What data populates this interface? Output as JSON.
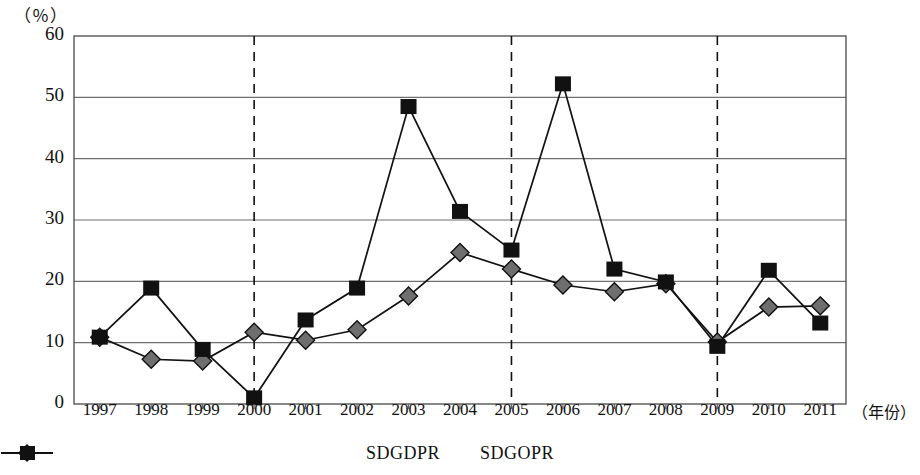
{
  "chart_data": {
    "type": "line",
    "title": "",
    "xlabel": "（年份）",
    "ylabel": "（％）",
    "x": [
      "1997",
      "1998",
      "1999",
      "2000",
      "2001",
      "2002",
      "2003",
      "2004",
      "2005",
      "2006",
      "2007",
      "2008",
      "2009",
      "2010",
      "2011"
    ],
    "ylim": [
      0,
      60
    ],
    "yticks": [
      "0",
      "10",
      "20",
      "30",
      "40",
      "50",
      "60"
    ],
    "grid": "horizontal",
    "legend_position": "bottom-center",
    "series": [
      {
        "name": "SDGDPR",
        "marker": "diamond",
        "color": "#6e6e6e",
        "values": [
          10.9,
          7.3,
          7.0,
          11.7,
          10.4,
          12.1,
          17.6,
          24.7,
          22.0,
          19.4,
          18.3,
          19.6,
          10.1,
          15.8,
          16.0
        ]
      },
      {
        "name": "SDGOPR",
        "marker": "square",
        "color": "#111111",
        "values": [
          10.9,
          18.9,
          8.9,
          1.0,
          13.7,
          18.9,
          48.5,
          31.4,
          25.1,
          52.2,
          22.0,
          19.9,
          9.4,
          21.8,
          13.2
        ]
      }
    ],
    "annotations": [
      {
        "type": "vertical-dashed-line",
        "x": "2000"
      },
      {
        "type": "vertical-dashed-line",
        "x": "2005"
      },
      {
        "type": "vertical-dashed-line",
        "x": "2009"
      }
    ]
  },
  "legend": {
    "items": [
      {
        "label": "SDGDPR"
      },
      {
        "label": "SDGOPR"
      }
    ]
  }
}
